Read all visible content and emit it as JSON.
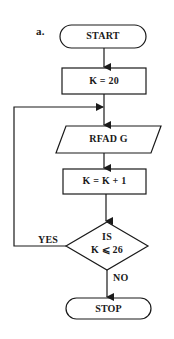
{
  "figure_label": "a.",
  "nodes": {
    "start": {
      "label": "START",
      "shape": "terminal"
    },
    "init": {
      "label": "K = 20",
      "shape": "process"
    },
    "read": {
      "label": "RFAD G",
      "shape": "input-output"
    },
    "increment": {
      "label": "K = K + 1",
      "shape": "process"
    },
    "decision": {
      "line1": "IS",
      "line2": "K ⩽ 26",
      "shape": "decision"
    },
    "stop": {
      "label": "STOP",
      "shape": "terminal"
    }
  },
  "edges": {
    "yes_label": "YES",
    "no_label": "NO"
  },
  "colors": {
    "stroke": "#1a1a1a",
    "background": "#ffffff"
  }
}
